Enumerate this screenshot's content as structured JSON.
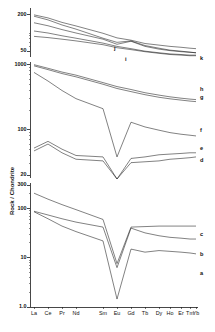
{
  "figure": {
    "y_axis_title": "Rock / Chondrite",
    "background": "#ffffff",
    "line_color": "#1a1a1a"
  },
  "chart_data": {
    "type": "line",
    "title": "",
    "subtitle": "",
    "xlabel": "",
    "ylabel": "Rock / Chondrite",
    "log_y": true,
    "grid": false,
    "legend_position": "right-inline",
    "x": [
      "La",
      "Ce",
      "Pr",
      "Nd",
      "Sm",
      "Eu",
      "Gd",
      "Tb",
      "Dy",
      "Ho",
      "Er",
      "Tm",
      "Yb"
    ],
    "xtick_labels": [
      "La",
      "Ce",
      "Pr",
      "Nd",
      "Sm",
      "Eu",
      "Gd",
      "Tb",
      "Dy",
      "Ho",
      "Er",
      "Tm",
      "Yb"
    ],
    "panels": [
      {
        "name": "top-panel",
        "ylim": [
          40,
          260
        ],
        "ytick_labels": [
          "200",
          "50"
        ],
        "ytick_values": [
          200,
          50
        ],
        "series": [
          {
            "name": "k",
            "label": "k",
            "values": [
              200,
              178,
              150,
              131,
              99,
              83,
              76,
              67,
              63,
              60,
              58,
              56,
              55
            ]
          },
          {
            "name": "j",
            "label": "j",
            "values": [
              190,
              165,
              136,
              116,
              82,
              70,
              74,
              62,
              56,
              52,
              50,
              48,
              47
            ]
          },
          {
            "name": "i",
            "label": "i",
            "values": [
              148,
              132,
              114,
              100,
              79,
              65,
              73,
              60,
              54,
              51,
              49,
              48,
              47
            ]
          },
          {
            "name": "h",
            "label": "h",
            "values": [
              108,
              100,
              90,
              82,
              68,
              60,
              55,
              50,
              47,
              45,
              44,
              43,
              43
            ]
          },
          {
            "name": "g",
            "label": "g",
            "values": [
              88,
              84,
              79,
              74,
              64,
              57,
              53,
              49,
              46,
              44,
              43,
              42,
              42
            ]
          }
        ]
      },
      {
        "name": "middle-panel",
        "ylim": [
          18,
          1100
        ],
        "ytick_labels": [
          "1000",
          "100",
          "20"
        ],
        "ytick_values": [
          1000,
          100,
          20
        ],
        "series": [
          {
            "name": "h",
            "label": "h",
            "values": [
              1000,
              880,
              770,
              690,
              530,
              460,
              415,
              370,
              340,
              320,
              305,
              295,
              290
            ]
          },
          {
            "name": "g",
            "label": "g",
            "values": [
              960,
              840,
              730,
              650,
              500,
              430,
              385,
              345,
              315,
              298,
              285,
              275,
              270
            ]
          },
          {
            "name": "f",
            "label": "f",
            "values": [
              760,
              560,
              400,
              300,
              210,
              38,
              130,
              110,
              98,
              90,
              85,
              82,
              80
            ]
          },
          {
            "name": "e",
            "label": "e",
            "values": [
              52,
              66,
              50,
              40,
              38,
              15,
              36,
              38,
              41,
              42,
              43,
              44,
              44
            ]
          },
          {
            "name": "d",
            "label": "d",
            "values": [
              47,
              60,
              44,
              35,
              33,
              13.5,
              31,
              32,
              33,
              35,
              36,
              37,
              38
            ]
          }
        ]
      },
      {
        "name": "bottom-panel",
        "ylim": [
          1.0,
          330
        ],
        "ytick_labels": [
          "300",
          "100",
          "10",
          "1.0"
        ],
        "ytick_values": [
          300,
          100,
          10,
          1.0
        ],
        "series": [
          {
            "name": "c",
            "label": "c",
            "values": [
              205,
              155,
              120,
              95,
              60,
              7.6,
              42,
              43,
              44,
              44,
              44,
              44,
              44
            ]
          },
          {
            "name": "b",
            "label": "b",
            "values": [
              88,
              74,
              62,
              53,
              42,
              6.3,
              40,
              32,
              28,
              26,
              25,
              24,
              24
            ]
          },
          {
            "name": "a",
            "label": "a",
            "values": [
              86,
              62,
              44,
              34,
              22,
              1.45,
              15,
              13,
              14,
              13.5,
              13,
              12.5,
              12
            ]
          }
        ]
      }
    ],
    "curve_labels": [
      "a",
      "b",
      "c",
      "d",
      "e",
      "f",
      "g",
      "h",
      "i",
      "j",
      "k"
    ]
  }
}
